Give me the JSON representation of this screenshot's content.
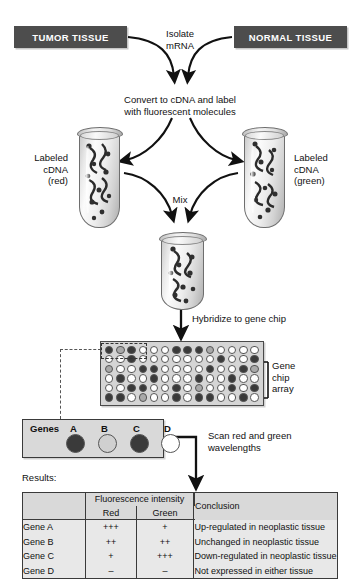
{
  "diagram": {
    "sources": {
      "tumor_label": "TUMOR TISSUE",
      "normal_label": "NORMAL TISSUE"
    },
    "steps": {
      "isolate": "Isolate\nmRNA",
      "convert": "Convert to cDNA and label\nwith fluorescent molecules",
      "mix": "Mix",
      "hybridize": "Hybridize to gene chip",
      "scan": "Scan red and green\nwavelengths",
      "results_label": "Results:"
    },
    "tubes": {
      "left_label": "Labeled\ncDNA\n(red)",
      "right_label": "Labeled\ncDNA\n(green)"
    },
    "chip": {
      "array_label": "Gene\nchip\narray",
      "rows": 6,
      "cols": 14,
      "shades": [
        [
          "dark",
          "mid",
          "dark",
          "white",
          "white",
          "white",
          "dark",
          "dark",
          "dark",
          "mid",
          "white",
          "white",
          "white",
          "white"
        ],
        [
          "white",
          "white",
          "dark",
          "white",
          "white",
          "white",
          "white",
          "white",
          "white",
          "white",
          "dark",
          "white",
          "white",
          "dark"
        ],
        [
          "mid",
          "white",
          "white",
          "dark",
          "dark",
          "white",
          "white",
          "white",
          "white",
          "dark",
          "white",
          "white",
          "dark",
          "mid"
        ],
        [
          "white",
          "dark",
          "white",
          "white",
          "dark",
          "white",
          "white",
          "white",
          "dark",
          "white",
          "white",
          "dark",
          "white",
          "white"
        ],
        [
          "white",
          "white",
          "dark",
          "dark",
          "white",
          "white",
          "dark",
          "white",
          "mid",
          "white",
          "white",
          "dark",
          "white",
          "dark"
        ],
        [
          "dark",
          "dark",
          "white",
          "mid",
          "white",
          "white",
          "dark",
          "white",
          "dark",
          "dark",
          "white",
          "white",
          "dark",
          "white"
        ]
      ]
    },
    "genes_strip": {
      "title": "Genes",
      "spots": [
        {
          "label": "A",
          "shade": "dark"
        },
        {
          "label": "B",
          "shade": "light"
        },
        {
          "label": "C",
          "shade": "dark"
        },
        {
          "label": "D",
          "shade": "white"
        }
      ]
    },
    "results": {
      "group_header": "Fluorescence intensity",
      "columns": [
        "",
        "Red",
        "Green",
        "Conclusion"
      ],
      "rows": [
        {
          "gene": "Gene A",
          "red": "+++",
          "green": "+",
          "conclusion": "Up-regulated in neoplastic tissue"
        },
        {
          "gene": "Gene B",
          "red": "++",
          "green": "++",
          "conclusion": "Unchanged in neoplastic tissue"
        },
        {
          "gene": "Gene C",
          "red": "+",
          "green": "+++",
          "conclusion": "Down-regulated in neoplastic tissue"
        },
        {
          "gene": "Gene D",
          "red": "–",
          "green": "–",
          "conclusion": "Not expressed in either tissue"
        }
      ]
    },
    "colors": {
      "box_fill": "#4d4d4d",
      "box_text": "#ffffff",
      "panel_fill": "#d9d9d9",
      "table_fill": "#e8e8e8",
      "stroke": "#3a3a3a",
      "spot_dark": "#3a3a3a",
      "spot_mid": "#a9a9a9",
      "spot_light": "#d0d0d0",
      "spot_white": "#ffffff"
    }
  }
}
